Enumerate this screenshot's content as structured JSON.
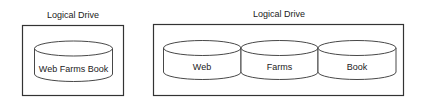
{
  "diagram": {
    "left_group": {
      "title": "Logical Drive",
      "disks": [
        {
          "label": "Web Farms Book"
        }
      ]
    },
    "right_group": {
      "title": "Logical Drive",
      "disks": [
        {
          "label": "Web"
        },
        {
          "label": "Farms"
        },
        {
          "label": "Book"
        }
      ]
    },
    "colors": {
      "stroke": "#333333",
      "background": "#ffffff",
      "text": "#222222"
    }
  }
}
